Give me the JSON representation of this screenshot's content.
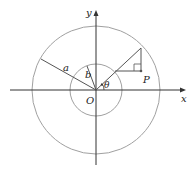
{
  "diagram": {
    "title": "",
    "labels": {
      "x_axis": "x",
      "y_axis": "y",
      "origin": "O",
      "outer_radius": "a",
      "inner_radius": "b",
      "point": "P",
      "angle": "θ"
    },
    "geometry": {
      "origin": [
        96,
        90
      ],
      "outer_circle_radius": 64,
      "inner_circle_radius": 26,
      "ray_end_outer": [
        141,
        48
      ],
      "ray_inner_intersection": [
        115,
        71
      ],
      "point_P": [
        141,
        71
      ]
    },
    "colors": {
      "axes": "#333333",
      "circles": "#9a9a9a",
      "lines": "#555555",
      "text": "#222222"
    }
  }
}
